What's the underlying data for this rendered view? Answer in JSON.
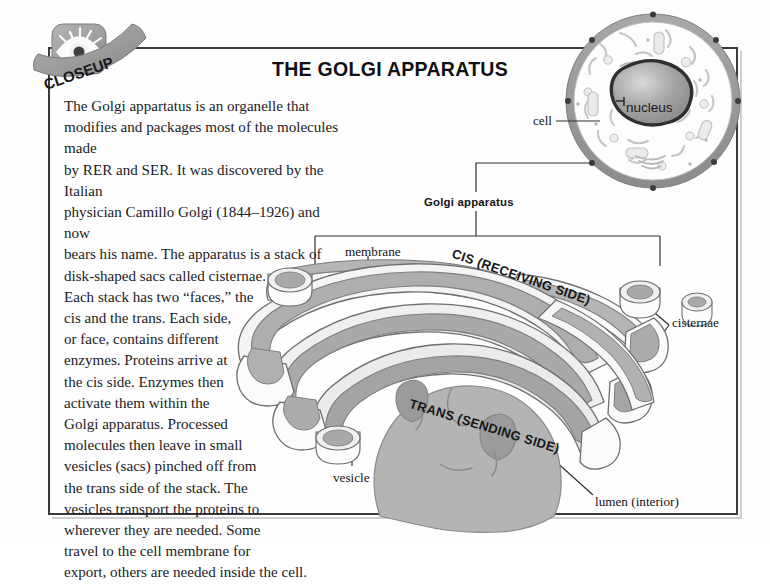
{
  "page": {
    "badge_label": "CLOSEUP",
    "badge_icon": "eye-icon",
    "title": "THE GOLGI APPARATUS"
  },
  "body": {
    "paragraph": "The Golgi appartatus is an organelle that modifies and packages most of the molecules made by RER and SER. It was discovered by the Italian physician Camillo Golgi (1844–1926) and now bears his name. The apparatus is a stack of disk-shaped sacs called cisternae. Each stack has two “faces,” the cis and the trans. Each side, or face, contains different enzymes. Proteins arrive at the cis side. Enzymes then activate them within the Golgi apparatus. Processed molecules then leave in small vesicles (sacs) pinched off from the trans side of the stack. The vesicles transport the proteins to wherever they are needed. Some travel to the cell membrane for export, others are needed inside the cell.",
    "lines": [
      "The Golgi appartatus is an organelle that",
      "modifies and packages most of the molecules made",
      "by RER and SER. It was discovered by the Italian",
      "physician Camillo Golgi (1844–1926) and now",
      "bears his name. The apparatus is a stack of",
      "disk-shaped sacs called cisternae.",
      "Each stack has two “faces,” the",
      "cis and the trans. Each side,",
      "or face, contains different",
      "enzymes. Proteins arrive at",
      "the cis side. Enzymes then",
      "activate them within the",
      "Golgi apparatus. Processed",
      "molecules then leave in small",
      "vesicles (sacs) pinched off from",
      "the trans side of the stack. The",
      "vesicles transport the proteins to",
      "wherever they are needed. Some",
      "travel to the cell membrane for",
      "export, others are needed inside the cell."
    ]
  },
  "labels": {
    "cell": "cell",
    "nucleus": "nucleus",
    "golgi_apparatus": "Golgi apparatus",
    "membrane": "membrane",
    "cisternae": "cisternae",
    "vesicle": "vesicle",
    "lumen": "lumen (interior)",
    "cis": "CIS (RECEIVING SIDE)",
    "trans": "TRANS (SENDING SIDE)"
  },
  "colors": {
    "frame": "#3a3a3c",
    "page_background": "#fefefe",
    "membrane_outer": "#f2f2f2",
    "membrane_mid": "#d6d6d6",
    "lumen_fill": "#a9a9a9",
    "lumen_fill_light": "#bdbdbd",
    "cell_rim": "#8f8f8f",
    "nucleus_fill": "#9b9b9b",
    "badge_grey": "#9a9a9a",
    "outline": "#6e6e70",
    "text": "#141417"
  }
}
